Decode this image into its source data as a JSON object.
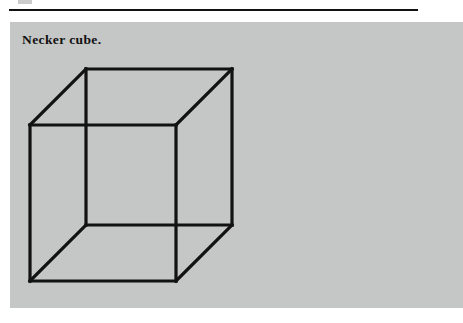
{
  "page": {
    "background_color": "#ffffff",
    "width": 463,
    "height": 323
  },
  "header_rule": {
    "name": "horizontal-rule",
    "color": "#121212",
    "x": 9,
    "y": 9,
    "width": 409,
    "thickness": 2
  },
  "figure": {
    "panel_color": "#c5c6c6",
    "caption": "Necker cube.",
    "caption_color": "#111111",
    "line_color": "#121212",
    "line_width": 3.2,
    "illustration_name": "necker-cube",
    "vertices": {
      "front_top_left": [
        20,
        103
      ],
      "front_top_right": [
        166,
        103
      ],
      "front_bottom_right": [
        166,
        259
      ],
      "front_bottom_left": [
        20,
        259
      ],
      "back_top_left": [
        76,
        47
      ],
      "back_top_right": [
        222,
        47
      ],
      "back_bottom_right": [
        222,
        203
      ],
      "back_bottom_left": [
        76,
        203
      ]
    },
    "edges": [
      {
        "name": "front-top-edge",
        "from": "front_top_left",
        "to": "front_top_right"
      },
      {
        "name": "front-right-edge",
        "from": "front_top_right",
        "to": "front_bottom_right"
      },
      {
        "name": "front-bottom-edge",
        "from": "front_bottom_right",
        "to": "front_bottom_left"
      },
      {
        "name": "front-left-edge",
        "from": "front_bottom_left",
        "to": "front_top_left"
      },
      {
        "name": "back-top-edge",
        "from": "back_top_left",
        "to": "back_top_right"
      },
      {
        "name": "back-right-edge",
        "from": "back_top_right",
        "to": "back_bottom_right"
      },
      {
        "name": "back-bottom-edge",
        "from": "back_bottom_right",
        "to": "back_bottom_left"
      },
      {
        "name": "back-left-edge",
        "from": "back_bottom_left",
        "to": "back_top_left"
      },
      {
        "name": "connector-top-left",
        "from": "front_top_left",
        "to": "back_top_left"
      },
      {
        "name": "connector-top-right",
        "from": "front_top_right",
        "to": "back_top_right"
      },
      {
        "name": "connector-bottom-right",
        "from": "front_bottom_right",
        "to": "back_bottom_right"
      },
      {
        "name": "connector-bottom-left",
        "from": "front_bottom_left",
        "to": "back_bottom_left"
      }
    ]
  }
}
